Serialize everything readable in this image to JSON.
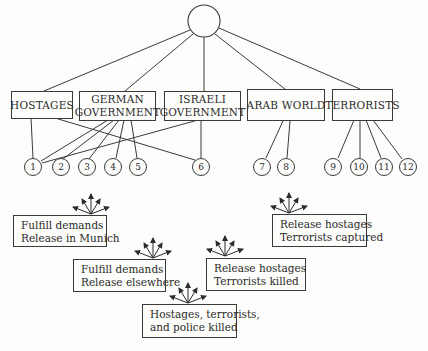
{
  "diagram": {
    "root": {
      "label": ""
    },
    "actors": [
      {
        "id": "hostages",
        "label_lines": [
          "HOSTAGES"
        ]
      },
      {
        "id": "german_government",
        "label_lines": [
          "GERMAN",
          "GOVERNMENT"
        ]
      },
      {
        "id": "israeli_government",
        "label_lines": [
          "ISRAELI",
          "GOVERNMENT"
        ]
      },
      {
        "id": "arab_world",
        "label_lines": [
          "ARAB WORLD"
        ]
      },
      {
        "id": "terrorists",
        "label_lines": [
          "TERRORISTS"
        ]
      }
    ],
    "options": [
      "1",
      "2",
      "3",
      "4",
      "5",
      "6",
      "7",
      "8",
      "9",
      "10",
      "11",
      "12"
    ],
    "edges": [
      [
        "root",
        "hostages"
      ],
      [
        "root",
        "german_government"
      ],
      [
        "root",
        "israeli_government"
      ],
      [
        "root",
        "arab_world"
      ],
      [
        "root",
        "terrorists"
      ],
      [
        "hostages",
        "1"
      ],
      [
        "hostages",
        "6"
      ],
      [
        "german_government",
        "1"
      ],
      [
        "german_government",
        "2"
      ],
      [
        "german_government",
        "3"
      ],
      [
        "german_government",
        "4"
      ],
      [
        "german_government",
        "5"
      ],
      [
        "israeli_government",
        "1"
      ],
      [
        "israeli_government",
        "6"
      ],
      [
        "arab_world",
        "7"
      ],
      [
        "arab_world",
        "8"
      ],
      [
        "terrorists",
        "9"
      ],
      [
        "terrorists",
        "10"
      ],
      [
        "terrorists",
        "11"
      ],
      [
        "terrorists",
        "12"
      ]
    ],
    "outcomes": [
      {
        "id": "munich",
        "label_lines": [
          "Fulfill demands",
          "Release in Munich"
        ]
      },
      {
        "id": "elsewhere",
        "label_lines": [
          "Fulfill demands",
          "Release elsewhere"
        ]
      },
      {
        "id": "all_killed",
        "label_lines": [
          "Hostages, terrorists,",
          "and police killed"
        ]
      },
      {
        "id": "terrorists_killed",
        "label_lines": [
          "Release hostages",
          "Terrorists killed"
        ]
      },
      {
        "id": "terrorists_captured",
        "label_lines": [
          "Release hostages",
          "Terrorists captured"
        ]
      }
    ]
  },
  "colors": {
    "line": "#3a3a3a",
    "background": "#fdfdfb",
    "text": "#2a2a2a"
  }
}
